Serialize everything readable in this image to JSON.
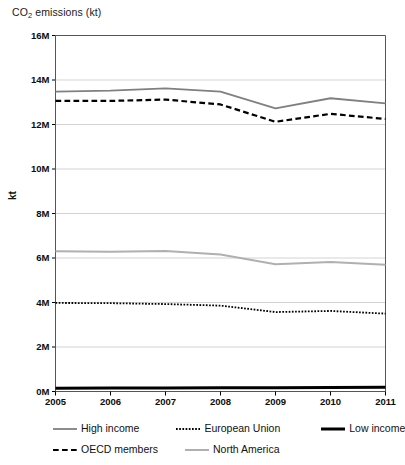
{
  "chart_data": {
    "type": "line",
    "title": "CO2 emissions (kt)",
    "title_main": "CO",
    "title_sub": "2",
    "title_rest": " emissions (kt)",
    "xlabel": "",
    "ylabel": "kt",
    "x": [
      2005,
      2006,
      2007,
      2008,
      2009,
      2010,
      2011
    ],
    "xticklabels": [
      "2005",
      "2006",
      "2007",
      "2008",
      "2009",
      "2010",
      "2011"
    ],
    "yticks": [
      0,
      2000000,
      4000000,
      6000000,
      8000000,
      10000000,
      12000000,
      14000000,
      16000000
    ],
    "yticklabels": [
      "0M",
      "2M",
      "4M",
      "6M",
      "8M",
      "10M",
      "12M",
      "14M",
      "16M"
    ],
    "ylim": [
      0,
      16000000
    ],
    "xlim": [
      2005,
      2011
    ],
    "grid": true,
    "grid_axis": "y",
    "legend_position": "below",
    "series": [
      {
        "name": "High income",
        "color": "#808080",
        "style": "solid",
        "width": 1.8,
        "values": [
          13480000,
          13520000,
          13620000,
          13480000,
          12720000,
          13180000,
          12950000
        ]
      },
      {
        "name": "European Union",
        "color": "#000000",
        "style": "dotted",
        "width": 1.8,
        "values": [
          3980000,
          3970000,
          3930000,
          3860000,
          3570000,
          3620000,
          3500000
        ]
      },
      {
        "name": "Low income",
        "color": "#000000",
        "style": "solid",
        "width": 3.0,
        "values": [
          150000,
          155000,
          160000,
          168000,
          172000,
          180000,
          186000
        ]
      },
      {
        "name": "OECD members",
        "color": "#000000",
        "style": "dashed",
        "width": 2.2,
        "values": [
          13060000,
          13060000,
          13120000,
          12900000,
          12120000,
          12480000,
          12250000
        ]
      },
      {
        "name": "North America",
        "color": "#b0b0b0",
        "style": "solid",
        "width": 2.0,
        "values": [
          6300000,
          6280000,
          6320000,
          6160000,
          5720000,
          5820000,
          5700000
        ]
      }
    ]
  },
  "legend": {
    "rows": [
      [
        {
          "label": "High income",
          "series_index": 0
        },
        {
          "label": "European Union",
          "series_index": 1
        },
        {
          "label": "Low income",
          "series_index": 2
        }
      ],
      [
        {
          "label": "OECD members",
          "series_index": 3
        },
        {
          "label": "North America",
          "series_index": 4
        }
      ]
    ]
  }
}
